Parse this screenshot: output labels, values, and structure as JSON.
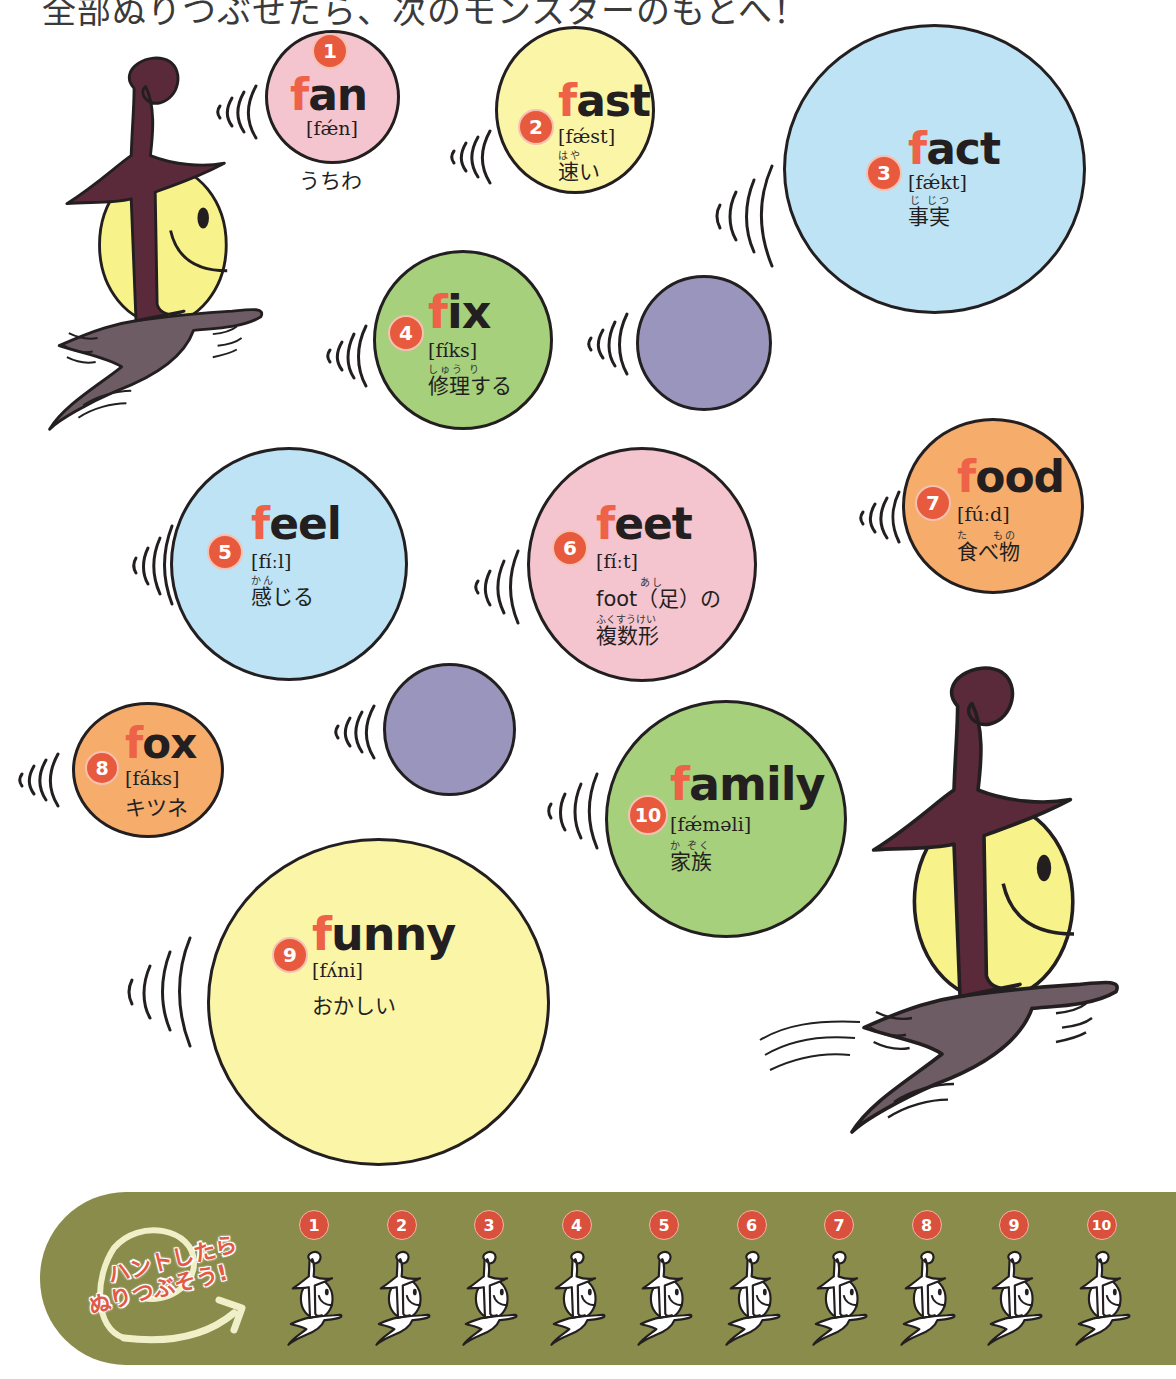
{
  "instruction": "全部ぬりつぶせたら、次のモンスターのもとへ！",
  "colors": {
    "accent_f": "#ee6248",
    "number_badge": "#e85a3e",
    "pink": "#f4c4cf",
    "yellow": "#fbf5a8",
    "blue": "#bde3f5",
    "green": "#a6d07c",
    "orange": "#f6ad6c",
    "purple": "#9a95bd",
    "banner": "#8a8c4b",
    "monster_hat": "#5a2a3a",
    "monster_body": "#f8f28a",
    "monster_cape": "#6e5c64"
  },
  "words": [
    {
      "number": "1",
      "first": "f",
      "rest": "an",
      "ipa": "[fǽn]",
      "ruby": "",
      "meaning": "うちわ"
    },
    {
      "number": "2",
      "first": "f",
      "rest": "ast",
      "ipa": "[fǽst]",
      "ruby": "はや",
      "meaning": "速い"
    },
    {
      "number": "3",
      "first": "f",
      "rest": "act",
      "ipa": "[fǽkt]",
      "ruby": "じ じつ",
      "meaning": "事実"
    },
    {
      "number": "4",
      "first": "f",
      "rest": "ix",
      "ipa": "[fíks]",
      "ruby": "しゅう り",
      "meaning": "修理する"
    },
    {
      "number": "5",
      "first": "f",
      "rest": "eel",
      "ipa": "[fíːl]",
      "ruby": "かん",
      "meaning": "感じる"
    },
    {
      "number": "6",
      "first": "f",
      "rest": "eet",
      "ipa": "[fíːt]",
      "ruby": "あし",
      "meaning": "foot（足）の",
      "ruby2": "ふくすうけい",
      "meaning2": "複数形"
    },
    {
      "number": "7",
      "first": "f",
      "rest": "ood",
      "ipa": "[fúːd]",
      "ruby": "た　　もの",
      "meaning": "食べ物"
    },
    {
      "number": "8",
      "first": "f",
      "rest": "ox",
      "ipa": "[fáks]",
      "ruby": "",
      "meaning": "キツネ"
    },
    {
      "number": "9",
      "first": "f",
      "rest": "unny",
      "ipa": "[fʌ́ni]",
      "ruby": "",
      "meaning": "おかしい"
    },
    {
      "number": "10",
      "first": "f",
      "rest": "amily",
      "ipa": "[fǽməli]",
      "ruby": "か ぞく",
      "meaning": "家族"
    }
  ],
  "banner": {
    "line1": "ハントしたら",
    "line2": "ぬりつぶそう!",
    "slots": [
      "1",
      "2",
      "3",
      "4",
      "5",
      "6",
      "7",
      "8",
      "9",
      "10"
    ]
  }
}
